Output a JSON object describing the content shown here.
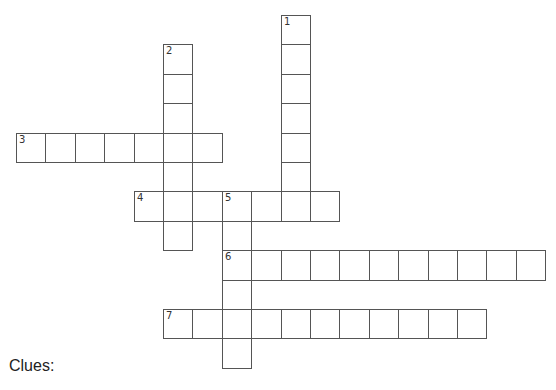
{
  "puzzle": {
    "grid": {
      "origin_x": 16,
      "origin_y": 15,
      "cell_size": 29.4
    },
    "words": [
      {
        "number": "1",
        "direction": "down",
        "row": 0,
        "col": 9,
        "length": 7
      },
      {
        "number": "2",
        "direction": "down",
        "row": 1,
        "col": 5,
        "length": 7
      },
      {
        "number": "3",
        "direction": "across",
        "row": 4,
        "col": 0,
        "length": 7
      },
      {
        "number": "4",
        "direction": "across",
        "row": 6,
        "col": 4,
        "length": 7
      },
      {
        "number": "5",
        "direction": "down",
        "row": 6,
        "col": 7,
        "length": 6
      },
      {
        "number": "6",
        "direction": "across",
        "row": 8,
        "col": 7,
        "length": 11
      },
      {
        "number": "7",
        "direction": "across",
        "row": 10,
        "col": 5,
        "length": 11
      }
    ]
  },
  "clues": {
    "label": "Clues:"
  },
  "colors": {
    "cell_border": "#555555",
    "background": "#ffffff"
  }
}
